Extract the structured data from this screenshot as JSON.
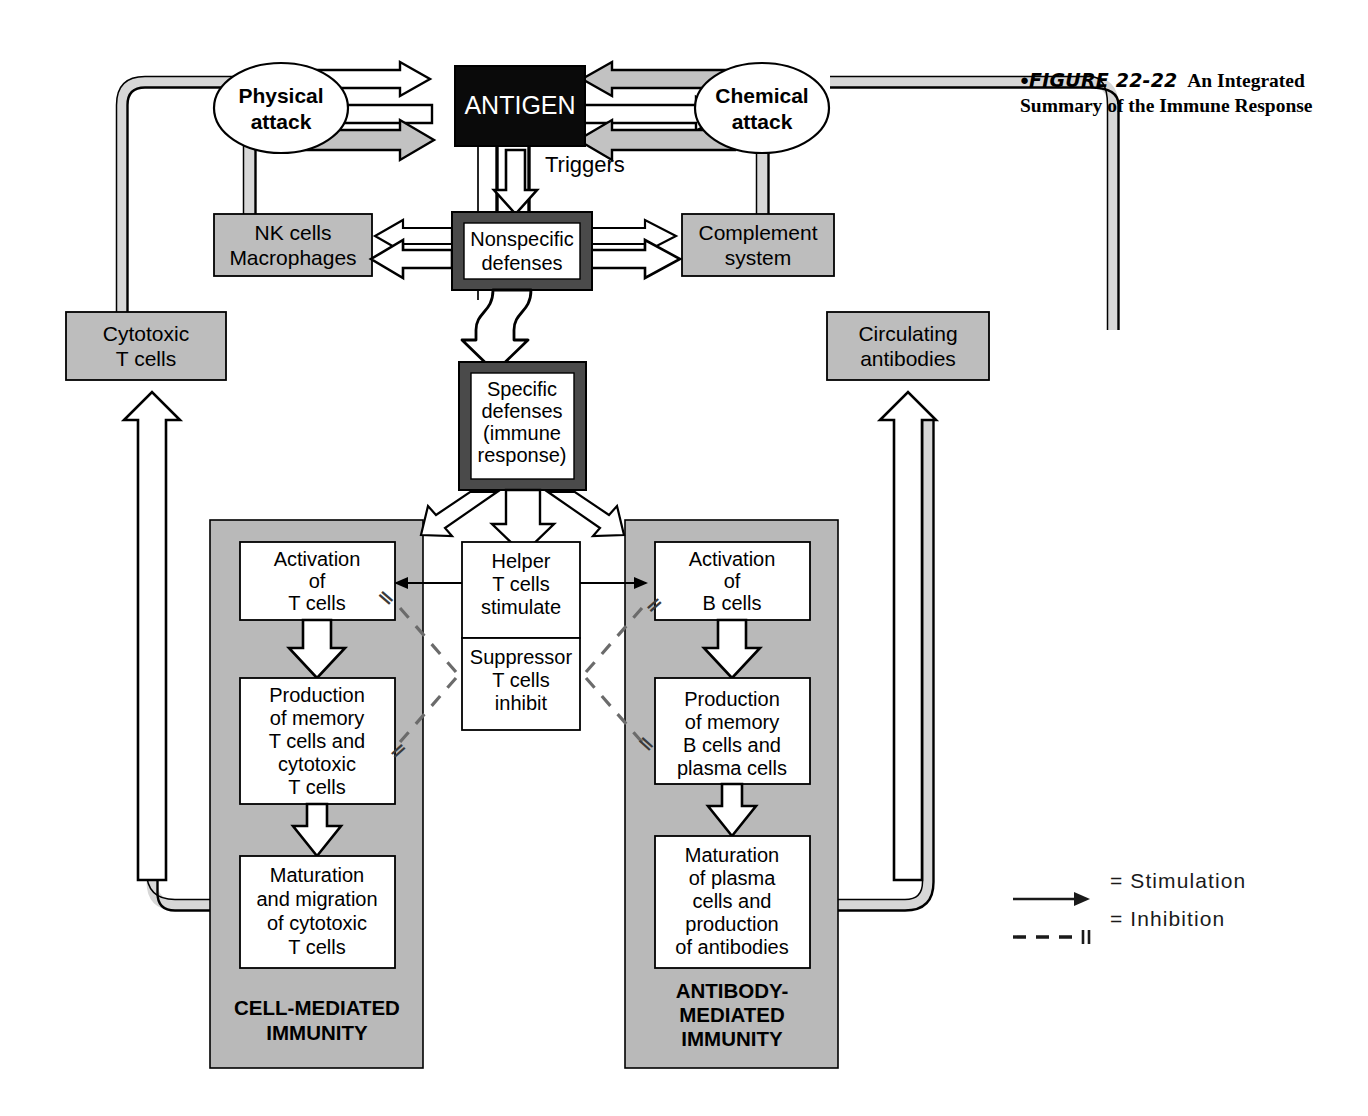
{
  "figure": {
    "bullet": "●",
    "number": "FIGURE 22-22",
    "title": "An Integrated Summary of the Immune Response"
  },
  "nodes": {
    "antigen": "ANTIGEN",
    "physical_attack": "Physical\nattack",
    "chemical_attack": "Chemical\nattack",
    "physical_attack_l1": "Physical",
    "physical_attack_l2": "attack",
    "chemical_attack_l1": "Chemical",
    "chemical_attack_l2": "attack",
    "nk_macrophages_l1": "NK cells",
    "nk_macrophages_l2": "Macrophages",
    "complement_l1": "Complement",
    "complement_l2": "system",
    "nonspecific_l1": "Nonspecific",
    "nonspecific_l2": "defenses",
    "triggers": "Triggers",
    "specific_l1": "Specific",
    "specific_l2": "defenses",
    "specific_l3": "(immune",
    "specific_l4": "response)",
    "cytotoxic_l1": "Cytotoxic",
    "cytotoxic_l2": "T cells",
    "circulating_l1": "Circulating",
    "circulating_l2": "antibodies",
    "activation_t_l1": "Activation",
    "activation_t_l2": "of",
    "activation_t_l3": "T cells",
    "production_t_l1": "Production",
    "production_t_l2": "of memory",
    "production_t_l3": "T cells and",
    "production_t_l4": "cytotoxic",
    "production_t_l5": "T cells",
    "maturation_t_l1": "Maturation",
    "maturation_t_l2": "and migration",
    "maturation_t_l3": "of cytotoxic",
    "maturation_t_l4": "T cells",
    "activation_b_l1": "Activation",
    "activation_b_l2": "of",
    "activation_b_l3": "B cells",
    "production_b_l1": "Production",
    "production_b_l2": "of memory",
    "production_b_l3": "B cells and",
    "production_b_l4": "plasma cells",
    "maturation_b_l1": "Maturation",
    "maturation_b_l2": "of plasma",
    "maturation_b_l3": "cells and",
    "maturation_b_l4": "production",
    "maturation_b_l5": "of antibodies",
    "helper_l1": "Helper",
    "helper_l2": "T cells",
    "helper_l3": "stimulate",
    "suppressor_l1": "Suppressor",
    "suppressor_l2": "T cells",
    "suppressor_l3": "inhibit",
    "panel_left_l1": "CELL-MEDIATED",
    "panel_left_l2": "IMMUNITY",
    "panel_right_l1": "ANTIBODY-",
    "panel_right_l2": "MEDIATED",
    "panel_right_l3": "IMMUNITY"
  },
  "legend": {
    "stimulation": "= Stimulation",
    "inhibition": "= Inhibition",
    "inhibition_mark": "‖"
  },
  "inhibition_marks": {
    "left_upper": "‖",
    "left_lower": "‖",
    "right_upper": "‖",
    "right_lower": "‖"
  },
  "colors": {
    "panel_gray": "#b9b9b9",
    "box_gray": "#bdbdbd",
    "band_gray": "#d7d7d7",
    "arrow_gray": "#c2c2c2",
    "black": "#000000",
    "border_dark": "#3d3d3d",
    "white": "#ffffff"
  }
}
